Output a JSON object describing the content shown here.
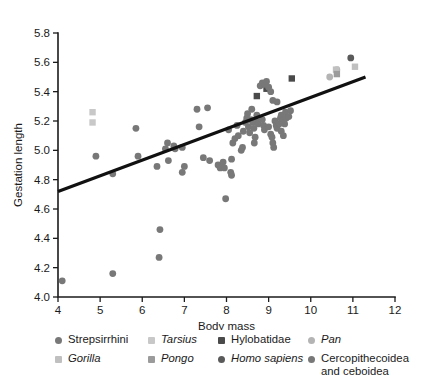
{
  "chart_data": {
    "type": "scatter",
    "title": "",
    "xlabel": "Body mass",
    "ylabel": "Gestation length",
    "xlim": [
      4,
      12
    ],
    "ylim": [
      4.0,
      5.8
    ],
    "xticks": [
      "4",
      "5",
      "6",
      "7",
      "8",
      "9",
      "10",
      "11",
      "12"
    ],
    "yticks": [
      "4.0",
      "4.2",
      "4.4",
      "4.6",
      "4.8",
      "5.0",
      "5.2",
      "5.4",
      "5.6",
      "5.8"
    ],
    "grid": false,
    "legend_position": "below-axis",
    "trendline": {
      "label": "regression line",
      "x_start": 4.0,
      "y_start": 4.72,
      "x_end": 11.3,
      "y_end": 5.5
    },
    "series": [
      {
        "name": "Strepsirrhini",
        "marker": "circle",
        "color": "#787878",
        "points": [
          [
            4.1,
            4.11
          ],
          [
            5.3,
            4.16
          ],
          [
            6.4,
            4.27
          ],
          [
            6.42,
            4.46
          ],
          [
            4.9,
            4.96
          ],
          [
            5.3,
            4.84
          ],
          [
            5.85,
            5.15
          ],
          [
            5.9,
            4.96
          ],
          [
            6.55,
            5.01
          ],
          [
            6.6,
            5.05
          ],
          [
            6.62,
            4.93
          ],
          [
            6.75,
            5.03
          ],
          [
            6.78,
            5.01
          ],
          [
            6.95,
            5.02
          ],
          [
            7.0,
            4.89
          ],
          [
            6.35,
            4.89
          ],
          [
            6.95,
            4.85
          ],
          [
            7.35,
            5.16
          ],
          [
            7.3,
            5.28
          ],
          [
            7.55,
            5.29
          ],
          [
            7.45,
            4.95
          ],
          [
            7.6,
            4.93
          ],
          [
            7.8,
            4.9
          ],
          [
            7.85,
            4.88
          ],
          [
            7.92,
            4.92
          ],
          [
            7.95,
            4.88
          ],
          [
            8.05,
            5.14
          ]
        ]
      },
      {
        "name": "Tarsius",
        "marker": "square",
        "color": "#c8c8c8",
        "points": [
          [
            4.82,
            5.26
          ],
          [
            4.82,
            5.19
          ]
        ]
      },
      {
        "name": "Hylobatidae",
        "marker": "square",
        "color": "#4a4a4a",
        "points": [
          [
            9.55,
            5.49
          ],
          [
            8.95,
            5.42
          ],
          [
            8.72,
            5.37
          ]
        ]
      },
      {
        "name": "Pan",
        "marker": "circle",
        "color": "#b4b4b4",
        "points": [
          [
            10.45,
            5.5
          ],
          [
            10.62,
            5.55
          ]
        ]
      },
      {
        "name": "Gorilla",
        "marker": "square",
        "color": "#c0c0c0",
        "points": [
          [
            11.05,
            5.57
          ],
          [
            10.6,
            5.55
          ]
        ]
      },
      {
        "name": "Pongo",
        "marker": "square",
        "color": "#9b9b9b",
        "points": [
          [
            10.62,
            5.52
          ]
        ]
      },
      {
        "name": "Homo sapiens",
        "marker": "circle",
        "color": "#5a5a5a",
        "points": [
          [
            10.95,
            5.63
          ]
        ]
      },
      {
        "name": "Cercopithecoidea and ceboidea",
        "marker": "circle",
        "color": "#787878",
        "points": [
          [
            8.15,
            5.05
          ],
          [
            8.2,
            5.08
          ],
          [
            8.25,
            5.17
          ],
          [
            8.28,
            5.1
          ],
          [
            8.12,
            4.94
          ],
          [
            8.1,
            4.85
          ],
          [
            8.12,
            4.83
          ],
          [
            8.4,
            5.13
          ],
          [
            8.45,
            5.19
          ],
          [
            8.48,
            5.22
          ],
          [
            8.5,
            5.25
          ],
          [
            8.52,
            5.16
          ],
          [
            8.55,
            5.12
          ],
          [
            8.58,
            5.21
          ],
          [
            8.6,
            5.28
          ],
          [
            8.62,
            5.19
          ],
          [
            8.65,
            5.15
          ],
          [
            8.7,
            5.2
          ],
          [
            8.72,
            5.24
          ],
          [
            8.75,
            5.18
          ],
          [
            8.8,
            5.44
          ],
          [
            8.85,
            5.46
          ],
          [
            8.9,
            5.45
          ],
          [
            8.95,
            5.47
          ],
          [
            9.0,
            5.43
          ],
          [
            9.05,
            5.4
          ],
          [
            9.1,
            5.34
          ],
          [
            8.85,
            5.21
          ],
          [
            8.88,
            5.17
          ],
          [
            8.9,
            5.14
          ],
          [
            9.0,
            5.16
          ],
          [
            9.05,
            5.11
          ],
          [
            9.08,
            5.09
          ],
          [
            9.15,
            5.2
          ],
          [
            9.18,
            5.17
          ],
          [
            9.2,
            5.15
          ],
          [
            9.25,
            5.18
          ],
          [
            9.28,
            5.22
          ],
          [
            9.3,
            5.24
          ],
          [
            9.35,
            5.2
          ],
          [
            9.38,
            5.18
          ],
          [
            9.4,
            5.26
          ],
          [
            9.42,
            5.22
          ],
          [
            9.1,
            5.05
          ],
          [
            9.12,
            5.02
          ],
          [
            9.2,
            5.33
          ],
          [
            9.48,
            5.23
          ],
          [
            9.52,
            5.27
          ],
          [
            8.68,
            5.09
          ],
          [
            8.66,
            5.05
          ],
          [
            7.98,
            4.67
          ],
          [
            8.35,
            5.0
          ],
          [
            8.38,
            5.02
          ],
          [
            9.3,
            5.13
          ],
          [
            9.35,
            5.1
          ]
        ]
      }
    ]
  },
  "legend": {
    "columns": [
      {
        "items": [
          {
            "label": "Strepsirrhini",
            "marker": "circle",
            "color": "#787878",
            "italic": false
          },
          {
            "label": "Gorilla",
            "marker": "square",
            "color": "#c0c0c0",
            "italic": true
          }
        ]
      },
      {
        "items": [
          {
            "label": "Tarsius",
            "marker": "square",
            "color": "#c8c8c8",
            "italic": true
          },
          {
            "label": "Pongo",
            "marker": "square",
            "color": "#9b9b9b",
            "italic": true
          }
        ]
      },
      {
        "items": [
          {
            "label": "Hylobatidae",
            "marker": "square",
            "color": "#4a4a4a",
            "italic": false
          },
          {
            "label": "Homo sapiens",
            "marker": "circle",
            "color": "#5a5a5a",
            "italic": true
          }
        ]
      },
      {
        "items": [
          {
            "label": "Pan",
            "marker": "circle",
            "color": "#b4b4b4",
            "italic": true
          },
          {
            "label": "Cercopithecoidea and ceboidea",
            "marker": "circle",
            "color": "#787878",
            "italic": false
          }
        ]
      }
    ]
  }
}
